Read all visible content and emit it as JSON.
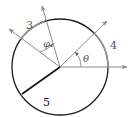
{
  "diagram": {
    "type": "circle-angle-diagram",
    "center": [
      60,
      67
    ],
    "radius": 48,
    "colors": {
      "circle": "#1a1a1a",
      "arc_highlight": "#9a9a9a",
      "ray": "#8a8a8a",
      "radius_line": "#111111",
      "label": "#555555"
    },
    "labels": {
      "arc_left": "3",
      "arc_right": "4",
      "radius": "5",
      "angle_phi": "φ",
      "angle_theta": "θ"
    }
  }
}
